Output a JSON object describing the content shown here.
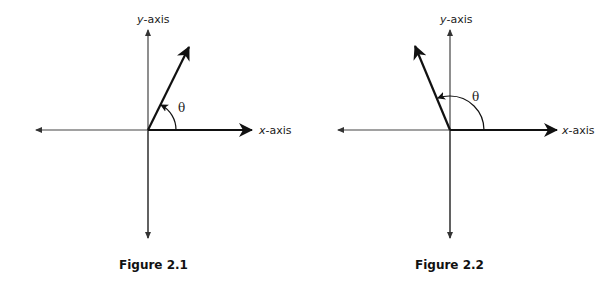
{
  "figures": [
    {
      "id": "fig1",
      "caption": "Figure 2.1",
      "x_axis_label_var": "x",
      "x_axis_label_rest": "-axis",
      "y_axis_label_var": "y",
      "y_axis_label_rest": "-axis",
      "angle_label": "θ",
      "angle_description": "acute angle (first quadrant), approx 63°",
      "vector_quadrant": "I"
    },
    {
      "id": "fig2",
      "caption": "Figure 2.2",
      "x_axis_label_var": "x",
      "x_axis_label_rest": "-axis",
      "y_axis_label_var": "y",
      "y_axis_label_rest": "-axis",
      "angle_label": "θ",
      "angle_description": "obtuse angle (second quadrant), approx 113°",
      "vector_quadrant": "II"
    }
  ],
  "colors": {
    "axis": "#333333",
    "vector": "#111111",
    "text": "#222222"
  }
}
